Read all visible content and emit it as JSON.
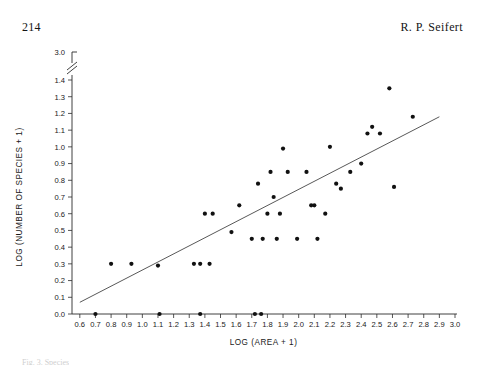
{
  "page": {
    "page_number": "214",
    "running_head": "R. P. Seifert",
    "caption_partial": "Fig. 3. Species"
  },
  "chart_data": {
    "type": "scatter",
    "title": "",
    "xlabel": "LOG (AREA + 1)",
    "ylabel": "LOG (NUMBER OF SPECIES + 1)",
    "xlim": [
      0.55,
      3.0
    ],
    "ylim": [
      0.0,
      1.45
    ],
    "grid": false,
    "legend": "none",
    "x_ticks": [
      "0.6",
      "0.7",
      "0.8",
      "0.9",
      "1.0",
      "1.1",
      "1.2",
      "1.3",
      "1.4",
      "1.5",
      "1.6",
      "1.7",
      "1.8",
      "1.9",
      "2.0",
      "2.1",
      "2.2",
      "2.3",
      "2.4",
      "2.5",
      "2.6",
      "2.7",
      "2.8",
      "2.9",
      "3.0"
    ],
    "y_ticks": [
      "0.0",
      "0.1",
      "0.2",
      "0.3",
      "0.4",
      "0.5",
      "0.6",
      "0.7",
      "0.8",
      "0.9",
      "1.0",
      "1.1",
      "1.2",
      "1.3",
      "1.4"
    ],
    "y_axis_break_label": "3.0",
    "y_axis_has_break": true,
    "marker": "filled-circle",
    "marker_color": "#111111",
    "line_color": "#3a3a3a",
    "fit_line": {
      "label": "least-squares regression",
      "x_start": 0.6,
      "y_start": 0.07,
      "x_end": 2.9,
      "y_end": 1.18
    },
    "points": [
      {
        "x": 0.7,
        "y": 0.0
      },
      {
        "x": 1.11,
        "y": 0.0
      },
      {
        "x": 1.37,
        "y": 0.0
      },
      {
        "x": 1.72,
        "y": 0.0
      },
      {
        "x": 1.76,
        "y": 0.0
      },
      {
        "x": 0.8,
        "y": 0.3
      },
      {
        "x": 0.93,
        "y": 0.3
      },
      {
        "x": 1.1,
        "y": 0.29
      },
      {
        "x": 1.33,
        "y": 0.3
      },
      {
        "x": 1.37,
        "y": 0.3
      },
      {
        "x": 1.43,
        "y": 0.3
      },
      {
        "x": 1.4,
        "y": 0.6
      },
      {
        "x": 1.45,
        "y": 0.6
      },
      {
        "x": 1.57,
        "y": 0.49
      },
      {
        "x": 1.62,
        "y": 0.65
      },
      {
        "x": 1.7,
        "y": 0.45
      },
      {
        "x": 1.74,
        "y": 0.78
      },
      {
        "x": 1.77,
        "y": 0.45
      },
      {
        "x": 1.8,
        "y": 0.6
      },
      {
        "x": 1.82,
        "y": 0.85
      },
      {
        "x": 1.84,
        "y": 0.7
      },
      {
        "x": 1.86,
        "y": 0.45
      },
      {
        "x": 1.88,
        "y": 0.6
      },
      {
        "x": 1.9,
        "y": 0.99
      },
      {
        "x": 1.93,
        "y": 0.85
      },
      {
        "x": 1.99,
        "y": 0.45
      },
      {
        "x": 2.05,
        "y": 0.85
      },
      {
        "x": 2.08,
        "y": 0.65
      },
      {
        "x": 2.1,
        "y": 0.65
      },
      {
        "x": 2.12,
        "y": 0.45
      },
      {
        "x": 2.17,
        "y": 0.6
      },
      {
        "x": 2.2,
        "y": 1.0
      },
      {
        "x": 2.24,
        "y": 0.78
      },
      {
        "x": 2.27,
        "y": 0.75
      },
      {
        "x": 2.33,
        "y": 0.85
      },
      {
        "x": 2.4,
        "y": 0.9
      },
      {
        "x": 2.44,
        "y": 1.08
      },
      {
        "x": 2.47,
        "y": 1.12
      },
      {
        "x": 2.52,
        "y": 1.08
      },
      {
        "x": 2.58,
        "y": 1.35
      },
      {
        "x": 2.61,
        "y": 0.76
      },
      {
        "x": 2.73,
        "y": 1.18
      }
    ]
  }
}
